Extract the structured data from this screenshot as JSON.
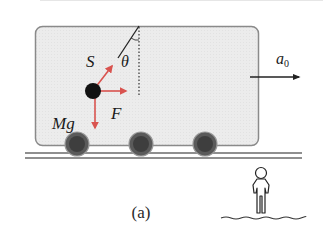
{
  "figure": {
    "caption": "(a)",
    "labels": {
      "tension": "S",
      "angle": "θ",
      "force": "F",
      "weight": "Mg",
      "acceleration": "a",
      "acceleration_subscript": "0"
    },
    "colors": {
      "cart_fill": "#ececec",
      "cart_stroke": "#8a8a8a",
      "force_arrow": "#d9534f",
      "ball": "#111111",
      "wheel_outer": "#5a5a5a",
      "wheel_inner": "#3a3a3a",
      "rail": "#6a6a6a",
      "text": "#1a1a1a"
    },
    "elements": {
      "cart": "Railway cart with rounded corners",
      "wheels": 3,
      "ball": "Pendulum bob suspended by string",
      "observer": "Stationary observer standing on ground"
    }
  }
}
